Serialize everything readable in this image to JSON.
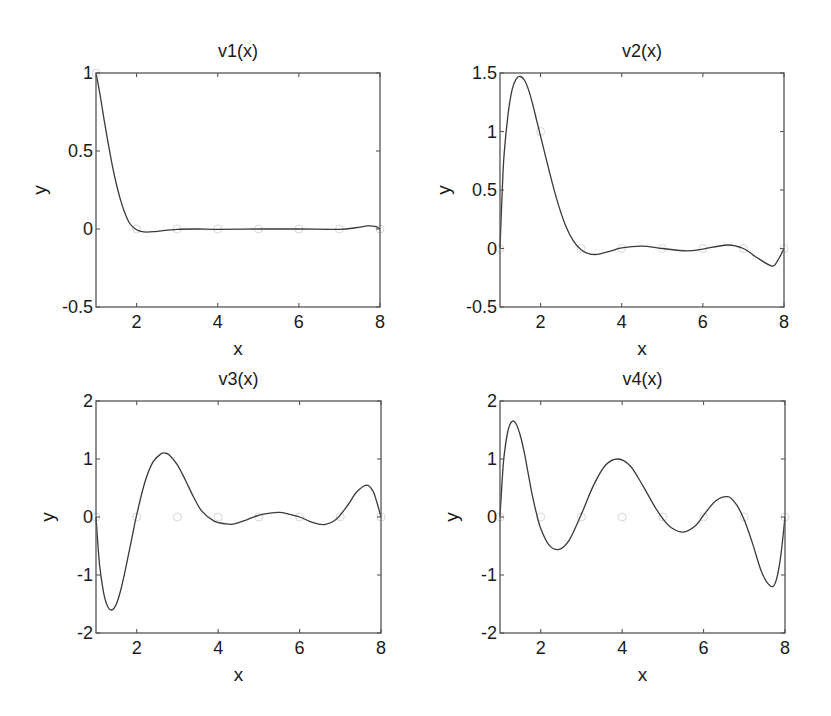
{
  "chart_data": [
    {
      "type": "line",
      "title": "v1(x)",
      "xlabel": "x",
      "ylabel": "y",
      "xlim": [
        1,
        8
      ],
      "ylim": [
        -0.5,
        1
      ],
      "xticks": [
        2,
        4,
        6,
        8
      ],
      "xtick_labels": [
        "2",
        "4",
        "6",
        "8"
      ],
      "yticks": [
        -0.5,
        0,
        0.5,
        1
      ],
      "ytick_labels": [
        "-0.5",
        "0",
        "0.5",
        "1"
      ],
      "grid": false,
      "series": [
        {
          "name": "v1",
          "x": [
            1.0,
            1.1,
            1.2,
            1.3,
            1.4,
            1.5,
            1.6,
            1.7,
            1.8,
            1.9,
            2.0,
            2.1,
            2.25,
            2.5,
            3.0,
            3.5,
            4.0,
            5.0,
            6.0,
            7.0,
            7.4,
            7.7,
            7.9,
            8.0
          ],
          "y": [
            1.0,
            0.86,
            0.7,
            0.55,
            0.41,
            0.29,
            0.19,
            0.11,
            0.05,
            0.015,
            -0.005,
            -0.015,
            -0.02,
            -0.015,
            -0.002,
            0.0,
            -0.002,
            0.0,
            0.0,
            -0.002,
            0.008,
            0.02,
            0.015,
            0.0
          ]
        }
      ],
      "markers": {
        "x": [
          1,
          2,
          3,
          4,
          5,
          6,
          7,
          8
        ],
        "y": [
          1,
          0,
          0,
          0,
          0,
          0,
          0,
          0
        ]
      }
    },
    {
      "type": "line",
      "title": "v2(x)",
      "xlabel": "x",
      "ylabel": "y",
      "xlim": [
        1,
        8
      ],
      "ylim": [
        -0.5,
        1.5
      ],
      "xticks": [
        2,
        4,
        6,
        8
      ],
      "xtick_labels": [
        "2",
        "4",
        "6",
        "8"
      ],
      "yticks": [
        -0.5,
        0,
        0.5,
        1,
        1.5
      ],
      "ytick_labels": [
        "-0.5",
        "0",
        "0.5",
        "1",
        "1.5"
      ],
      "grid": false,
      "series": [
        {
          "name": "v2",
          "x": [
            1.0,
            1.05,
            1.1,
            1.2,
            1.3,
            1.4,
            1.5,
            1.6,
            1.7,
            1.8,
            1.9,
            2.0,
            2.2,
            2.4,
            2.6,
            2.8,
            3.0,
            3.2,
            3.4,
            3.7,
            4.0,
            4.5,
            5.0,
            5.6,
            6.0,
            6.6,
            7.0,
            7.3,
            7.7,
            7.85,
            8.0
          ],
          "y": [
            0.0,
            0.45,
            0.8,
            1.15,
            1.36,
            1.45,
            1.47,
            1.44,
            1.36,
            1.24,
            1.1,
            0.96,
            0.68,
            0.42,
            0.21,
            0.07,
            -0.01,
            -0.045,
            -0.05,
            -0.025,
            0.005,
            0.02,
            0.0,
            -0.02,
            -0.005,
            0.03,
            0.0,
            -0.07,
            -0.15,
            -0.1,
            0.0
          ]
        }
      ],
      "markers": {
        "x": [
          1,
          2,
          3,
          4,
          5,
          6,
          7,
          8
        ],
        "y": [
          0,
          1,
          0,
          0,
          0,
          0,
          0,
          0
        ]
      }
    },
    {
      "type": "line",
      "title": "v3(x)",
      "xlabel": "x",
      "ylabel": "y",
      "xlim": [
        1,
        8
      ],
      "ylim": [
        -2,
        2
      ],
      "xticks": [
        2,
        4,
        6,
        8
      ],
      "xtick_labels": [
        "2",
        "4",
        "6",
        "8"
      ],
      "yticks": [
        -2,
        -1,
        0,
        1,
        2
      ],
      "ytick_labels": [
        "-2",
        "-1",
        "0",
        "1",
        "2"
      ],
      "grid": false,
      "series": [
        {
          "name": "v3",
          "x": [
            1.0,
            1.05,
            1.1,
            1.2,
            1.3,
            1.4,
            1.5,
            1.6,
            1.7,
            1.8,
            1.9,
            2.0,
            2.2,
            2.4,
            2.6,
            2.7,
            2.8,
            3.0,
            3.2,
            3.4,
            3.6,
            3.9,
            4.2,
            4.4,
            4.7,
            5.0,
            5.5,
            6.0,
            6.3,
            6.6,
            6.9,
            7.2,
            7.4,
            7.65,
            7.8,
            7.9,
            8.0
          ],
          "y": [
            0.0,
            -0.5,
            -0.9,
            -1.35,
            -1.56,
            -1.6,
            -1.5,
            -1.28,
            -0.98,
            -0.64,
            -0.3,
            0.04,
            0.6,
            0.95,
            1.09,
            1.1,
            1.07,
            0.9,
            0.63,
            0.34,
            0.1,
            -0.07,
            -0.12,
            -0.12,
            -0.05,
            0.03,
            0.08,
            0.0,
            -0.09,
            -0.13,
            -0.04,
            0.22,
            0.43,
            0.55,
            0.45,
            0.25,
            0.0
          ]
        }
      ],
      "markers": {
        "x": [
          1,
          2,
          3,
          4,
          5,
          6,
          7,
          8
        ],
        "y": [
          0,
          0,
          0,
          0,
          0,
          0,
          0,
          0
        ]
      }
    },
    {
      "type": "line",
      "title": "v4(x)",
      "xlabel": "x",
      "ylabel": "y",
      "xlim": [
        1,
        8
      ],
      "ylim": [
        -2,
        2
      ],
      "xticks": [
        2,
        4,
        6,
        8
      ],
      "xtick_labels": [
        "2",
        "4",
        "6",
        "8"
      ],
      "yticks": [
        -2,
        -1,
        0,
        1,
        2
      ],
      "ytick_labels": [
        "-2",
        "-1",
        "0",
        "1",
        "2"
      ],
      "grid": false,
      "series": [
        {
          "name": "v4",
          "x": [
            1.0,
            1.05,
            1.1,
            1.2,
            1.3,
            1.4,
            1.5,
            1.6,
            1.7,
            1.8,
            1.9,
            2.0,
            2.2,
            2.45,
            2.7,
            3.0,
            3.3,
            3.6,
            3.9,
            4.2,
            4.5,
            4.8,
            5.0,
            5.2,
            5.5,
            5.8,
            6.0,
            6.3,
            6.6,
            6.8,
            7.0,
            7.2,
            7.4,
            7.55,
            7.7,
            7.8,
            7.9,
            8.0
          ],
          "y": [
            0.0,
            0.6,
            1.05,
            1.5,
            1.65,
            1.6,
            1.4,
            1.1,
            0.72,
            0.35,
            0.05,
            -0.2,
            -0.48,
            -0.56,
            -0.4,
            0.05,
            0.55,
            0.9,
            1.0,
            0.88,
            0.55,
            0.18,
            -0.03,
            -0.18,
            -0.26,
            -0.15,
            0.03,
            0.28,
            0.35,
            0.22,
            -0.05,
            -0.45,
            -0.9,
            -1.12,
            -1.2,
            -1.05,
            -0.65,
            0.0
          ]
        }
      ],
      "markers": {
        "x": [
          1,
          2,
          3,
          4,
          5,
          6,
          7,
          8
        ],
        "y": [
          0,
          0,
          0,
          0,
          0,
          0,
          0,
          0
        ]
      }
    }
  ],
  "panels": [
    {
      "box": [
        96,
        73,
        380,
        307
      ]
    },
    {
      "box": [
        500,
        73,
        784,
        307
      ]
    },
    {
      "box": [
        96,
        401,
        381,
        633
      ]
    },
    {
      "box": [
        500,
        401,
        785,
        633
      ]
    }
  ]
}
